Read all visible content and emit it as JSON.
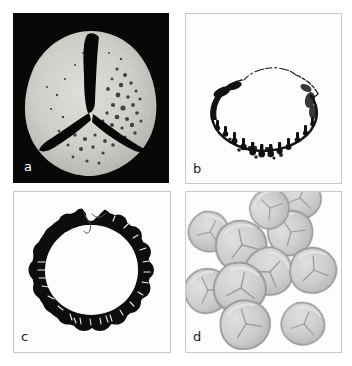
{
  "figure": {
    "type": "micrograph-plate",
    "layout": "2x2",
    "background_color": "#ffffff",
    "panel_count": 4
  },
  "panels": [
    {
      "id": "a",
      "label": "a",
      "label_color": "#ffffff",
      "background_color": "#080808",
      "imaging": "scanning-electron-micrograph",
      "subject": "single trilete spore, proximal polar view",
      "shape": "rounded-triangular",
      "surface": "punctate / foveolate with scattered pores",
      "aperture": "trilete Y-shaped laesura",
      "object_color": "#d5d3cd",
      "aperture_color": "#0a0a0a"
    },
    {
      "id": "b",
      "label": "b",
      "label_color": "#1b1b1b",
      "background_color": "#fdfdfd",
      "imaging": "light-micrograph optical section",
      "subject": "spore in equatorial optical section, high focus",
      "shape": "broad ellipse, open at top",
      "wall": "thin outline with dark verrucate projections along lower margin",
      "object_color": "#111111"
    },
    {
      "id": "c",
      "label": "c",
      "label_color": "#1b1b1b",
      "background_color": "#fdfdfd",
      "imaging": "light-micrograph optical section",
      "subject": "spore in equatorial optical section, low focus",
      "shape": "thick dark ring with notch at top",
      "wall": "heavily thickened, lobed / verrucate exine",
      "object_color": "#0d0d0d"
    },
    {
      "id": "d",
      "label": "d",
      "label_color": "#1b1b1b",
      "background_color": "#fdfdfd",
      "imaging": "light-micrograph, low magnification overview",
      "subject": "dispersed spore population",
      "grain_count": 11,
      "shape": "rounded-triangular grains with trilete marks",
      "object_fill_color": "#cfcfcf",
      "object_edge_color": "#8f8f8f"
    }
  ],
  "colors": {
    "panel_border": "#c9c9c9",
    "page_background": "#ffffff",
    "dark_panel": "#080808",
    "light_panel": "#fdfdfd",
    "ink": "#111111"
  }
}
